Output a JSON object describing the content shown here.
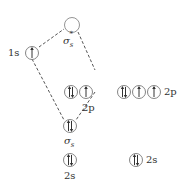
{
  "labels": {
    "h_1s": "1s",
    "sigma_star": "σ",
    "sigma_star_sub": "s",
    "sigma_star_sup": "*",
    "left_2p": "2p",
    "right_2p": "2p",
    "sigma": "σ",
    "sigma_sub": "s",
    "left_2s": "2s",
    "right_2s": "2s"
  },
  "orbitals": [
    {
      "id": "1s",
      "electrons": "up"
    },
    {
      "id": "sigma_star_s",
      "electrons": "empty"
    },
    {
      "id": "left_2p_1",
      "electrons": "pair"
    },
    {
      "id": "left_2p_2",
      "electrons": "up"
    },
    {
      "id": "sigma_s",
      "electrons": "pair"
    },
    {
      "id": "left_2s",
      "electrons": "pair"
    },
    {
      "id": "right_2p_1",
      "electrons": "pair"
    },
    {
      "id": "right_2p_2",
      "electrons": "up"
    },
    {
      "id": "right_2p_3",
      "electrons": "up"
    },
    {
      "id": "right_2s",
      "electrons": "pair"
    }
  ],
  "colors": {
    "line": "#555555",
    "circle": "#777777",
    "arrow": "#333333"
  }
}
